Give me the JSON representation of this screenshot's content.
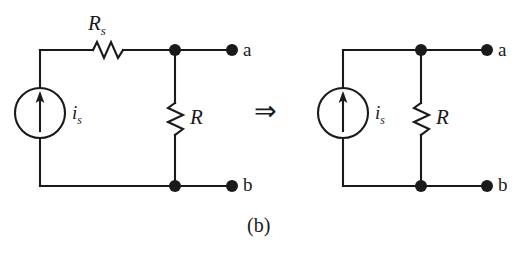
{
  "figure": {
    "caption": "(b)",
    "transform_symbol": "⇒",
    "background_color": "#ffffff",
    "ink_color": "#1a1a1a"
  },
  "circuits": [
    {
      "id": "left-circuit",
      "name": "practical-current-source-with-parallel-resistance",
      "components": [
        {
          "type": "current-source",
          "label": "i",
          "sublabel": "s",
          "arrow_direction": "up"
        },
        {
          "type": "resistor",
          "label": "R",
          "sublabel": "s",
          "orientation": "horizontal"
        },
        {
          "type": "resistor",
          "label": "R",
          "sublabel": "",
          "orientation": "vertical"
        }
      ],
      "terminals": [
        {
          "name": "a",
          "label": "a",
          "position": "top-right"
        },
        {
          "name": "b",
          "label": "b",
          "position": "bottom-right"
        }
      ],
      "junction_dots": 2
    },
    {
      "id": "right-circuit",
      "name": "simplified-current-source-with-parallel-resistance",
      "components": [
        {
          "type": "current-source",
          "label": "i",
          "sublabel": "s",
          "arrow_direction": "up"
        },
        {
          "type": "resistor",
          "label": "R",
          "sublabel": "",
          "orientation": "vertical"
        }
      ],
      "terminals": [
        {
          "name": "a",
          "label": "a",
          "position": "top-right"
        },
        {
          "name": "b",
          "label": "b",
          "position": "bottom-right"
        }
      ],
      "junction_dots": 2
    }
  ],
  "labels": {
    "left_series_resistor": "R",
    "left_series_resistor_sub": "s",
    "left_source": "i",
    "left_source_sub": "s",
    "left_parallel_resistor": "R",
    "left_terminal_a": "a",
    "left_terminal_b": "b",
    "right_source": "i",
    "right_source_sub": "s",
    "right_parallel_resistor": "R",
    "right_terminal_a": "a",
    "right_terminal_b": "b"
  }
}
